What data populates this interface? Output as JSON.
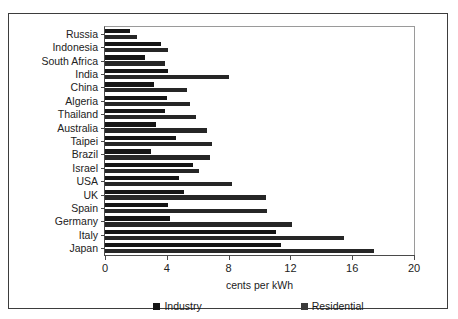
{
  "chart_data": {
    "type": "bar",
    "orientation": "horizontal",
    "title": "",
    "xlabel": "cents per kWh",
    "ylabel": "",
    "xlim": [
      0,
      20
    ],
    "xticks": [
      0,
      4,
      8,
      12,
      16,
      20
    ],
    "grid": false,
    "legend_position": "bottom",
    "categories": [
      "Russia",
      "Indonesia",
      "South Africa",
      "India",
      "China",
      "Algeria",
      "Thailand",
      "Australia",
      "Taipei",
      "Brazil",
      "Israel",
      "USA",
      "UK",
      "Spain",
      "Germany",
      "Italy",
      "Japan"
    ],
    "series": [
      {
        "name": "Industry",
        "color": "#151515",
        "values": [
          1.6,
          3.6,
          2.6,
          4.1,
          3.2,
          4.0,
          3.9,
          3.3,
          4.6,
          3.0,
          5.7,
          4.8,
          5.1,
          4.1,
          4.2,
          11.1,
          11.4
        ]
      },
      {
        "name": "Residential",
        "color": "#262626",
        "values": [
          2.1,
          4.1,
          3.9,
          8.0,
          5.3,
          5.5,
          5.9,
          6.6,
          6.9,
          6.8,
          6.1,
          8.2,
          10.4,
          10.5,
          12.1,
          15.5,
          17.4
        ]
      }
    ]
  },
  "legend": {
    "items": [
      {
        "label": "Industry"
      },
      {
        "label": "Residential"
      }
    ]
  },
  "axis": {
    "x_title": "cents per kWh",
    "tick_labels": [
      "0",
      "4",
      "8",
      "12",
      "16",
      "20"
    ]
  }
}
